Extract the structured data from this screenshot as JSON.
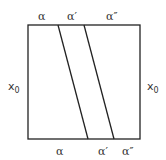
{
  "diagram": {
    "top_labels": [
      "α",
      "α′",
      "α″"
    ],
    "bottom_labels": [
      "α",
      "α′",
      "α″"
    ],
    "left_label": {
      "base": "x",
      "sub": "0"
    },
    "right_label": {
      "base": "x",
      "sub": "0"
    },
    "colors": {
      "stroke": "#222222",
      "text": "#333333",
      "background": "#ffffff"
    }
  }
}
